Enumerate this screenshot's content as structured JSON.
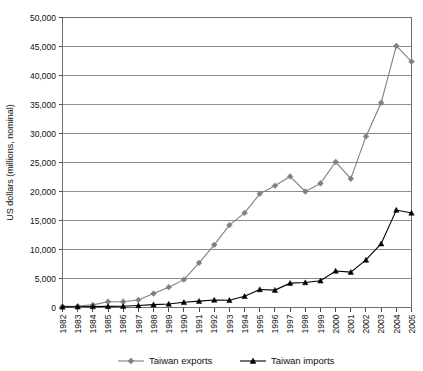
{
  "chart_data": {
    "type": "line",
    "title": "",
    "xlabel": "",
    "ylabel": "US dollars (millions, nominal)",
    "ylim": [
      0,
      50000
    ],
    "ytick_labels": [
      "0",
      "5,000",
      "10,000",
      "15,000",
      "20,000",
      "25,000",
      "30,000",
      "35,000",
      "40,000",
      "45,000",
      "50,000"
    ],
    "ytick_values": [
      0,
      5000,
      10000,
      15000,
      20000,
      25000,
      30000,
      35000,
      40000,
      45000,
      50000
    ],
    "grid": "horizontal",
    "legend_position": "bottom",
    "categories": [
      "1982",
      "1983",
      "1984",
      "1985",
      "1986",
      "1987",
      "1988",
      "1989",
      "1990",
      "1991",
      "1992",
      "1993",
      "1994",
      "1995",
      "1996",
      "1997",
      "1998",
      "1999",
      "2000",
      "2001",
      "2002",
      "2003",
      "2004",
      "2005"
    ],
    "series": [
      {
        "name": "Taiwan exports",
        "color": "#808080",
        "marker": "diamond",
        "values": [
          200,
          250,
          450,
          1000,
          1000,
          1300,
          2400,
          3500,
          4800,
          7700,
          10800,
          14200,
          16300,
          19600,
          21000,
          22600,
          20000,
          21400,
          25100,
          22200,
          29500,
          35300,
          45100,
          42400
        ]
      },
      {
        "name": "Taiwan imports",
        "color": "#000000",
        "marker": "triangle",
        "values": [
          100,
          120,
          180,
          200,
          220,
          350,
          500,
          600,
          900,
          1100,
          1300,
          1250,
          1950,
          3100,
          3000,
          4200,
          4300,
          4600,
          6300,
          6100,
          8200,
          11000,
          16800,
          16300
        ]
      }
    ]
  },
  "legend": {
    "items": [
      {
        "label": "Taiwan exports"
      },
      {
        "label": "Taiwan imports"
      }
    ]
  }
}
